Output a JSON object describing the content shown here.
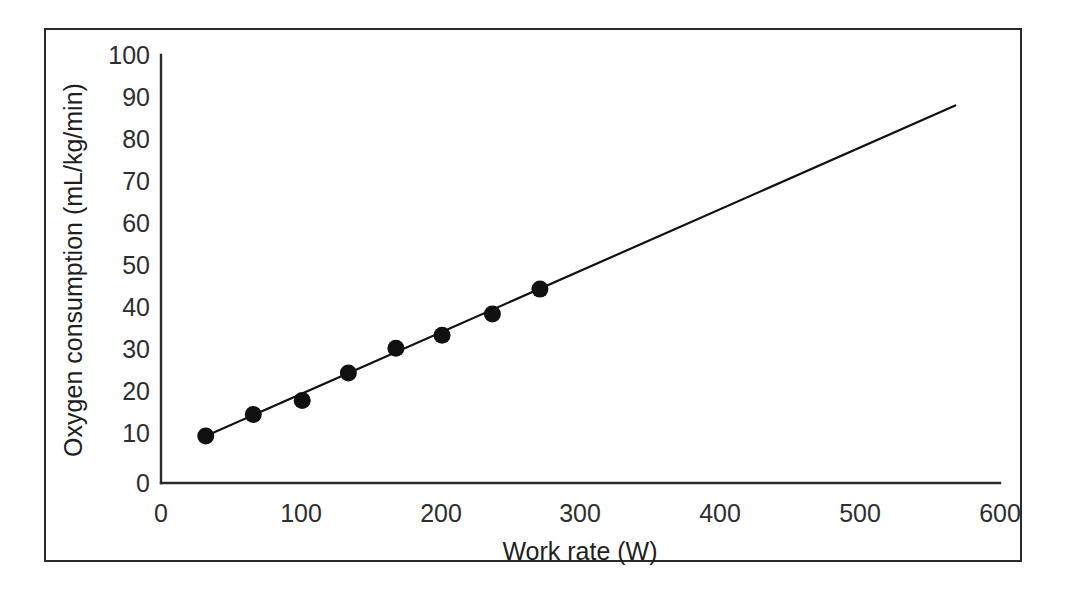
{
  "figure": {
    "border_color": "#2b2b2b",
    "background": "#ffffff"
  },
  "chart_data": {
    "type": "scatter",
    "title": "",
    "xlabel": "Work rate (W)",
    "ylabel": "Oxygen consumption (mL/kg/min)",
    "xlim": [
      0,
      600
    ],
    "ylim": [
      0,
      100
    ],
    "xticks": [
      0,
      100,
      200,
      300,
      400,
      500,
      600
    ],
    "yticks": [
      0,
      10,
      20,
      30,
      40,
      50,
      60,
      70,
      80,
      90,
      100
    ],
    "xtick_labels": [
      "0",
      "100",
      "200",
      "300",
      "400",
      "500",
      "600"
    ],
    "ytick_labels": [
      "0",
      "10",
      "20",
      "30",
      "40",
      "50",
      "60",
      "70",
      "80",
      "90",
      "100"
    ],
    "grid": false,
    "legend": false,
    "legend_position": "none",
    "marker_color": "#101010",
    "line_color": "#111111",
    "series": [
      {
        "name": "Measured oxygen consumption",
        "type": "scatter",
        "x": [
          32,
          66,
          101,
          134,
          168,
          201,
          237,
          271
        ],
        "y": [
          11.0,
          16.0,
          19.3,
          25.7,
          31.5,
          34.5,
          39.5,
          45.3
        ]
      },
      {
        "name": "Fitted regression line",
        "type": "line",
        "x": [
          28,
          568
        ],
        "y": [
          10.4,
          88.2
        ]
      }
    ]
  }
}
